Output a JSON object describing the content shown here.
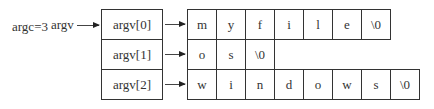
{
  "labels": {
    "argc": "argc=3",
    "argv": "argv"
  },
  "pointers": [
    "argv[0]",
    "argv[1]",
    "argv[2]"
  ],
  "strings": [
    [
      "m",
      "y",
      "f",
      "i",
      "l",
      "e",
      "\\0"
    ],
    [
      "o",
      "s",
      "\\0"
    ],
    [
      "w",
      "i",
      "n",
      "d",
      "o",
      "w",
      "s",
      "\\0"
    ]
  ]
}
